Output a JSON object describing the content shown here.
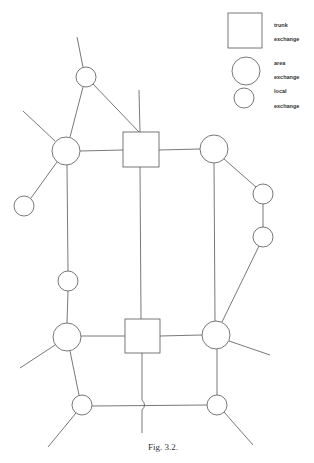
{
  "legend": {
    "trunk": {
      "line1": "trunk",
      "line2": "exchange"
    },
    "area": {
      "line1": "area",
      "line2": "exchange"
    },
    "local": {
      "line1": "local",
      "line2": "exchange"
    }
  },
  "caption": "Fig. 3.2.",
  "colors": {
    "stroke": "#555555",
    "background": "#ffffff"
  },
  "nodes": {
    "trunk": [
      {
        "id": "trunk-upper",
        "x": 123,
        "y": 132,
        "w": 36,
        "h": 35
      },
      {
        "id": "trunk-lower",
        "x": 125,
        "y": 319,
        "w": 35,
        "h": 34
      }
    ],
    "area": [
      {
        "id": "area-upper-left",
        "cx": 66,
        "cy": 151,
        "r": 14
      },
      {
        "id": "area-upper-right",
        "cx": 214,
        "cy": 149,
        "r": 14
      },
      {
        "id": "area-lower-left",
        "cx": 67,
        "cy": 337,
        "r": 14
      },
      {
        "id": "area-lower-right",
        "cx": 216,
        "cy": 335,
        "r": 14
      }
    ],
    "local": [
      {
        "id": "local-top",
        "cx": 86,
        "cy": 77,
        "r": 10
      },
      {
        "id": "local-far-left",
        "cx": 24,
        "cy": 206,
        "r": 10
      },
      {
        "id": "local-left-mid",
        "cx": 68,
        "cy": 281,
        "r": 10
      },
      {
        "id": "local-right-upper",
        "cx": 263,
        "cy": 194,
        "r": 10
      },
      {
        "id": "local-right-lower",
        "cx": 263,
        "cy": 237,
        "r": 10
      },
      {
        "id": "local-bottom-left",
        "cx": 82,
        "cy": 405,
        "r": 10
      },
      {
        "id": "local-bottom-right",
        "cx": 217,
        "cy": 405,
        "r": 10
      }
    ]
  }
}
